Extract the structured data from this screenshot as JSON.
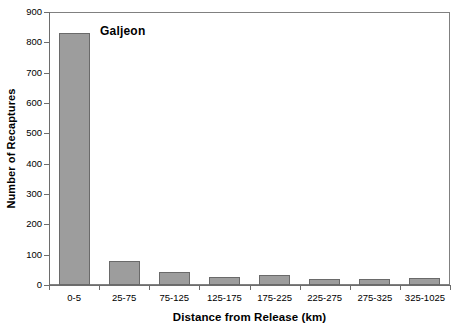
{
  "chart_data": {
    "type": "bar",
    "title": "",
    "series_label": "Galjeon",
    "xlabel": "Distance from Release (km)",
    "ylabel": "Number of Recaptures",
    "categories": [
      "0-5",
      "25-75",
      "75-125",
      "125-175",
      "175-225",
      "225-275",
      "275-325",
      "325-1025"
    ],
    "values": [
      830,
      78,
      43,
      28,
      32,
      20,
      19,
      22
    ],
    "ylim": [
      0,
      900
    ],
    "ytick_values": [
      0,
      100,
      200,
      300,
      400,
      500,
      600,
      700,
      800,
      900
    ],
    "ytick_labels": [
      "0",
      "100",
      "200",
      "300",
      "400",
      "500",
      "600",
      "700",
      "800",
      "900"
    ],
    "grid": false,
    "legend": "none",
    "bar_color": "#9d9d9d",
    "bar_edge_color": "#6a6a6a",
    "axis_color": "#6d6d6d",
    "background_color": "#ffffff"
  }
}
